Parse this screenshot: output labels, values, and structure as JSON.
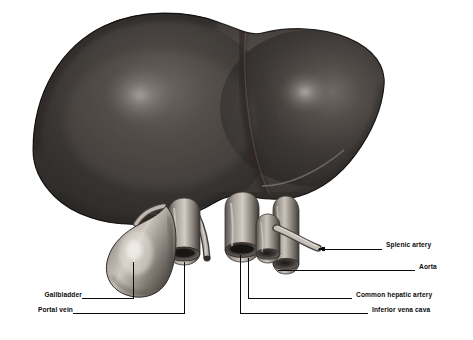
{
  "figure": {
    "style": "grayscale anatomical engraving / airbrush illustration",
    "background_color": "#ffffff",
    "ink_color": "#0a0a0a",
    "width": 473,
    "height": 340
  },
  "structures": [
    {
      "name": "liver-right-lobe",
      "label": "Right lobe of liver",
      "shading": "dark matte brown-black with specular highlight"
    },
    {
      "name": "liver-left-lobe",
      "label": "Left lobe of liver",
      "shading": "dark, separated by falciform ligament groove"
    },
    {
      "name": "gallbladder",
      "label": "Gallbladder",
      "shading": "pear-shaped sac, mid-gray with bright highlight"
    },
    {
      "name": "portal-vein",
      "label": "Portal vein",
      "shading": "cut tube, lumen visible"
    },
    {
      "name": "inferior-vena-cava",
      "label": "Inferior vena cava",
      "shading": "large cut vessel"
    },
    {
      "name": "common-hepatic-artery",
      "label": "Common hepatic artery",
      "shading": "cut vessel, lumen visible"
    },
    {
      "name": "aorta",
      "label": "Aorta",
      "shading": "cut vessel behind"
    },
    {
      "name": "splenic-artery",
      "label": "Splenic artery",
      "shading": "slender curving branch"
    }
  ],
  "labels": [
    {
      "id": "gallbladder",
      "text": "Gallbladder",
      "side": "left",
      "text_x": 18,
      "text_y": 295,
      "line_from_x": 82,
      "line_y": 298,
      "line_to_x": 133,
      "anchor_x": 133,
      "anchor_y": 262
    },
    {
      "id": "portal-vein",
      "text": "Portal vein",
      "side": "left",
      "text_x": 18,
      "text_y": 310,
      "line_from_x": 73,
      "line_y": 313,
      "line_to_x": 184,
      "anchor_x": 184,
      "anchor_y": 262
    },
    {
      "id": "splenic-artery",
      "text": "Splenic artery",
      "side": "right",
      "text_x": 386,
      "text_y": 245,
      "line_from_x": 382,
      "line_y": 249,
      "line_to_x": 318,
      "anchor_x": 318,
      "anchor_y": 249
    },
    {
      "id": "aorta",
      "text": "Aorta",
      "side": "right",
      "text_x": 419,
      "text_y": 267,
      "line_from_x": 415,
      "line_y": 270,
      "line_to_x": 278,
      "anchor_x": 278,
      "anchor_y": 270
    },
    {
      "id": "common-hepatic-artery",
      "text": "Common hepatic artery",
      "side": "right",
      "text_x": 356,
      "text_y": 295,
      "line_from_x": 352,
      "line_y": 298,
      "line_to_x": 248,
      "anchor_x": 248,
      "anchor_y": 258
    },
    {
      "id": "inferior-vena-cava",
      "text": "Inferior vena cava",
      "side": "right",
      "text_x": 372,
      "text_y": 310,
      "line_from_x": 368,
      "line_y": 313,
      "line_to_x": 240,
      "anchor_x": 240,
      "anchor_y": 255
    }
  ]
}
